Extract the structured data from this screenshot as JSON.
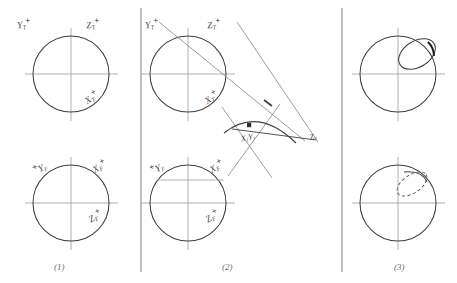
{
  "figure": {
    "kind": "hand-drawn-construction-diagram",
    "panel_count": 3,
    "ink_color": "#3f3f3f",
    "faint_ink_color": "#9a9a9a",
    "paper_color": "#ffffff"
  },
  "captions": [
    {
      "id": "caption-1",
      "text": "(1)"
    },
    {
      "id": "caption-2",
      "text": "(2)"
    },
    {
      "id": "caption-3",
      "text": "(3)"
    }
  ],
  "panel1": {
    "upper": {
      "labels": {
        "y_axis": {
          "base": "Y",
          "sub": "T",
          "sup": "+"
        },
        "z_axis": {
          "base": "Z",
          "sub": "T",
          "sup": "+"
        },
        "x_axis": {
          "base": "X",
          "sub": "T",
          "sup": "+"
        }
      }
    },
    "lower": {
      "labels": {
        "y_axis": {
          "base": "Y",
          "sub": "F",
          "sup": "+"
        },
        "x_axis": {
          "base": "X",
          "sub": "F",
          "sup": "+"
        },
        "z_axis": {
          "base": "Z",
          "sub": "F",
          "sup": "+"
        }
      }
    }
  },
  "panel2": {
    "upper": {
      "labels": {
        "y_axis": {
          "base": "Y",
          "sub": "T",
          "sup": "+"
        },
        "z_axis": {
          "base": "Z",
          "sub": "T",
          "sup": "+"
        },
        "x_axis": {
          "base": "X",
          "sub": "T",
          "sup": "+"
        }
      }
    },
    "construction": {
      "labels": {
        "xy_point": {
          "base": "X",
          "sub": "1",
          "base2": "Y",
          "sub2": "1"
        },
        "z_point": {
          "base": "Z",
          "sub": "1"
        }
      }
    },
    "lower": {
      "labels": {
        "y_axis": {
          "base": "Y",
          "sub": "F",
          "sup": "+"
        },
        "x_axis": {
          "base": "X",
          "sub": "F",
          "sup": "+"
        },
        "z_axis": {
          "base": "Z",
          "sub": "F",
          "sup": "+"
        }
      }
    }
  },
  "panel3": {
    "upper": {
      "overlay": "tilted-ellipse-upper-right-quadrant"
    },
    "lower": {
      "overlay": "small-dashed-ellipse-upper-right-quadrant"
    }
  }
}
